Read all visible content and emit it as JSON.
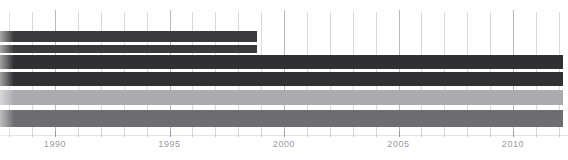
{
  "chart_data": {
    "type": "bar",
    "orientation": "horizontal",
    "title": "",
    "subtitle": "",
    "xlabel": "",
    "ylabel": "",
    "xlim": [
      1987.6,
      2012.4
    ],
    "grid": true,
    "legend": "none",
    "x_ticks_major": [
      1990,
      1995,
      2000,
      2005,
      2010
    ],
    "x_tick_labels": [
      "1990",
      "1995",
      "2000",
      "2005",
      "2010"
    ],
    "x_ticks_minor_step": 1,
    "categories": [
      "bar-1",
      "bar-2",
      "bar-3",
      "bar-4",
      "bar-5",
      "bar-6"
    ],
    "series": [
      {
        "name": "timeline-spans",
        "bars": [
          {
            "label": "bar-1",
            "start": 1987.6,
            "end": 1998.8,
            "color": "#3a3a3c",
            "top": 31,
            "height": 11
          },
          {
            "label": "bar-2",
            "start": 1987.6,
            "end": 1998.8,
            "color": "#3a3a3c",
            "top": 45,
            "height": 8
          },
          {
            "label": "bar-3",
            "start": 1987.6,
            "end": 2012.2,
            "color": "#303033",
            "top": 55,
            "height": 14
          },
          {
            "label": "bar-4",
            "start": 1987.6,
            "end": 2012.2,
            "color": "#313134",
            "top": 72,
            "height": 14
          },
          {
            "label": "bar-5",
            "start": 1987.6,
            "end": 2012.2,
            "color": "#ababaf",
            "top": 90,
            "height": 15
          },
          {
            "label": "bar-6",
            "start": 1987.6,
            "end": 2012.2,
            "color": "#6e6e72",
            "top": 110,
            "height": 17
          }
        ]
      }
    ],
    "colors": {
      "dark": "#3a3a3c",
      "darkest": "#303033",
      "light_gray": "#ababaf",
      "medium_gray": "#6e6e72",
      "gridline": "#d9d9dc",
      "gridline_major": "#b9b9bf",
      "tick_label": "#9a9aa1",
      "background": "#ffffff"
    }
  }
}
